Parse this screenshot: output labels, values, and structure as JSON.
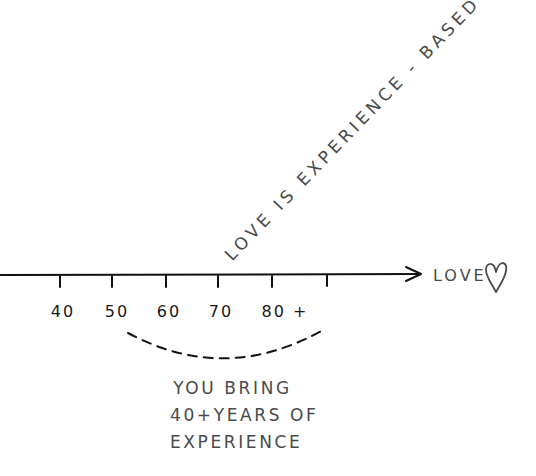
{
  "diagram": {
    "diagonal_label": "LOVE IS EXPERIENCE - BASED",
    "axis": {
      "end_label": "LOVE",
      "end_icon": "heart-icon",
      "ticks": [
        {
          "x": 60,
          "label": "40"
        },
        {
          "x": 112,
          "label": "50"
        },
        {
          "x": 166,
          "label": "60"
        },
        {
          "x": 218,
          "label": "70"
        },
        {
          "x": 272,
          "label": "80 +"
        },
        {
          "x": 327,
          "label": ""
        }
      ]
    },
    "caption": {
      "lines": [
        "YOU BRING",
        "40+YEARS OF",
        "EXPERIENCE"
      ]
    },
    "colors": {
      "line": "#111111",
      "text": "#4a4a4a",
      "background": "#ffffff"
    }
  }
}
